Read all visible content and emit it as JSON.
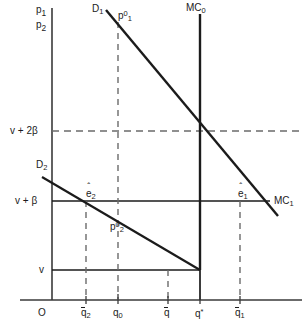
{
  "figure": {
    "title": "",
    "axes": {
      "y_axis_label_line1": "p",
      "y_axis_label_line1_sub": "1",
      "y_axis_label_line2": "p",
      "y_axis_label_line2_sub": "2",
      "origin_label": "O"
    },
    "y_ticks": [
      {
        "name": "v-plus-2beta",
        "label": "v + 2β",
        "y_px": 131
      },
      {
        "name": "v-plus-beta",
        "label": "v + β",
        "y_px": 201
      },
      {
        "name": "v",
        "label": "v",
        "y_px": 270
      }
    ],
    "x_ticks": [
      {
        "name": "q-bar-2",
        "base": "q",
        "overbar": true,
        "sub": "2",
        "sup": "",
        "x_px": 86
      },
      {
        "name": "q-0",
        "base": "q",
        "overbar": false,
        "sub": "0",
        "sup": "",
        "x_px": 118
      },
      {
        "name": "q-bar",
        "base": "q",
        "overbar": true,
        "sub": "",
        "sup": "",
        "x_px": 168
      },
      {
        "name": "q-star",
        "base": "q",
        "overbar": false,
        "sub": "",
        "sup": "*",
        "x_px": 200
      },
      {
        "name": "q-bar-1",
        "base": "q",
        "overbar": true,
        "sub": "1",
        "sup": "",
        "x_px": 240
      }
    ],
    "curves": [
      {
        "name": "demand-curve-1",
        "label_base": "D",
        "label_sub": "1",
        "label_x": 92,
        "label_y": 6
      },
      {
        "name": "demand-curve-2",
        "label_base": "D",
        "label_sub": "2",
        "label_x": 37,
        "label_y": 160
      },
      {
        "name": "marginal-cost-0",
        "label_base": "MC",
        "label_sub": "0",
        "label_x": 186,
        "label_y": 6
      },
      {
        "name": "marginal-cost-1",
        "label_base": "MC",
        "label_sub": "1",
        "label_x": 274,
        "label_y": 197
      }
    ],
    "points": [
      {
        "name": "price-p1-zero",
        "base": "p",
        "sub": "1",
        "sup": "0",
        "hat": false,
        "x": 118,
        "y": 10
      },
      {
        "name": "price-p2-zero",
        "base": "p",
        "sub": "2",
        "sup": "0",
        "hat": false,
        "x": 113,
        "y": 222
      },
      {
        "name": "equilibrium-e2",
        "base": "e",
        "sub": "2",
        "sup": "",
        "hat": true,
        "x": 88,
        "y": 189
      },
      {
        "name": "equilibrium-e1",
        "base": "e",
        "sub": "1",
        "sup": "",
        "hat": true,
        "x": 239,
        "y": 189
      }
    ],
    "colors": {
      "line": "#1b1b1b",
      "axis": "#3a3a3a",
      "dashed": "#6b6b6b",
      "background": "#ffffff"
    }
  }
}
